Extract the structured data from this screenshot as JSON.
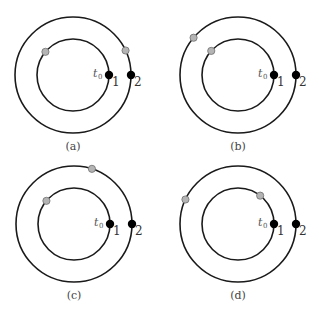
{
  "figure": {
    "colors": {
      "orbit": "#1a1a1a",
      "body_at_t0": "#000000",
      "later_position": "#b4b4b4"
    },
    "geometry": {
      "inner_radius": 36,
      "outer_radius": 58
    },
    "t0_label": "t",
    "t0_subscript": "0",
    "body_labels": [
      "1",
      "2"
    ],
    "panels": [
      {
        "id": "a",
        "caption": "(a)",
        "center": [
          73,
          75
        ],
        "inner_later_angle_deg": 140,
        "outer_later_angle_deg": 25
      },
      {
        "id": "b",
        "caption": "(b)",
        "center": [
          238,
          75
        ],
        "inner_later_angle_deg": 138,
        "outer_later_angle_deg": 140
      },
      {
        "id": "c",
        "caption": "(c)",
        "center": [
          74,
          224
        ],
        "inner_later_angle_deg": 140,
        "outer_later_angle_deg": 72
      },
      {
        "id": "d",
        "caption": "(d)",
        "center": [
          238,
          224
        ],
        "inner_later_angle_deg": 52,
        "outer_later_angle_deg": 155
      }
    ]
  }
}
